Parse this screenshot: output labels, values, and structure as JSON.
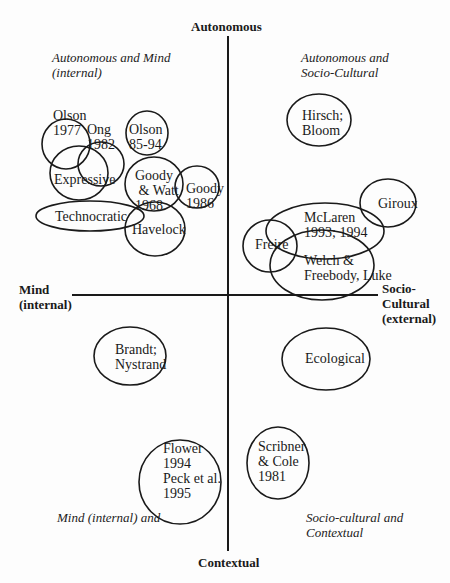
{
  "axes": {
    "top": "Autonomous",
    "bottom": "Contextual",
    "left": "Mind\n(internal)",
    "right": "Socio-\nCultural\n(external)"
  },
  "quadrants": {
    "top_left": "Autonomous and Mind\n(internal)",
    "top_right": "Autonomous and\nSocio-Cultural",
    "bottom_left": "Mind (internal) and",
    "bottom_right": "Socio-cultural and\nContextual"
  },
  "nodes": [
    {
      "id": "olson-1977",
      "label": "Olson\n1977"
    },
    {
      "id": "ong-1982",
      "label": "Ong\n1982"
    },
    {
      "id": "olson-85-94",
      "label": "Olson\n85-94"
    },
    {
      "id": "expressive",
      "label": "Expressive"
    },
    {
      "id": "goody-watt-1968",
      "label": "Goody\n & Watt\n1968"
    },
    {
      "id": "goody-1986",
      "label": "Goody\n1986"
    },
    {
      "id": "technocratic",
      "label": "Technocratic"
    },
    {
      "id": "havelock",
      "label": "Havelock"
    },
    {
      "id": "hirsch-bloom",
      "label": "Hirsch;\nBloom"
    },
    {
      "id": "giroux",
      "label": "Giroux"
    },
    {
      "id": "mclaren",
      "label": "McLaren\n1993; 1994"
    },
    {
      "id": "freire",
      "label": "Freire"
    },
    {
      "id": "welch-freebody-luke",
      "label": "Welch &\nFreebody, Luke"
    },
    {
      "id": "ecological",
      "label": "Ecological"
    },
    {
      "id": "brandt-nystrand",
      "label": "Brandt;\nNystrand"
    },
    {
      "id": "flower-peck",
      "label": "Flower\n1994\nPeck et al.\n1995"
    },
    {
      "id": "scribner-cole",
      "label": "Scribner\n& Cole\n1981"
    }
  ],
  "colors": {
    "stroke": "#1a1a1a",
    "background": "#fdfdfd"
  }
}
